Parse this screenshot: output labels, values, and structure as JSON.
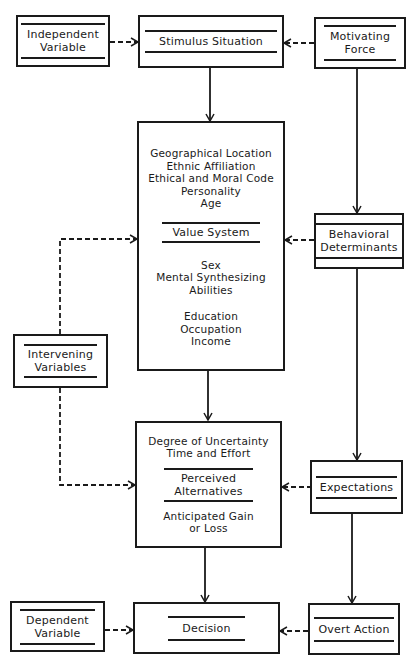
{
  "diagram": {
    "nodes": {
      "independent_variable": {
        "title": [
          "Independent",
          "Variable"
        ]
      },
      "stimulus_situation": {
        "title": [
          "Stimulus Situation"
        ]
      },
      "motivating_force": {
        "title": [
          "Motivating",
          "Force"
        ]
      },
      "value_system_box": {
        "pre_items": [
          "Geographical Location",
          "Ethnic Affiliation",
          "Ethical and Moral Code",
          "Personality",
          "Age"
        ],
        "title": "Value System",
        "post_items_1": [
          "Sex",
          "Mental Synthesizing",
          "Abilities"
        ],
        "post_items_2": [
          "Education",
          "Occupation",
          "Income"
        ]
      },
      "behavioral_determinants": {
        "title": [
          "Behavioral",
          "Determinants"
        ]
      },
      "intervening_variables": {
        "title": [
          "Intervening",
          "Variables"
        ]
      },
      "perceived_alternatives_box": {
        "pre_items": [
          "Degree of Uncertainty",
          "Time and Effort"
        ],
        "title": [
          "Perceived",
          "Alternatives"
        ],
        "post_items": [
          "Anticipated Gain",
          "or Loss"
        ]
      },
      "expectations": {
        "title": [
          "Expectations"
        ]
      },
      "dependent_variable": {
        "title": [
          "Dependent",
          "Variable"
        ]
      },
      "decision": {
        "title": [
          "Decision"
        ]
      },
      "overt_action": {
        "title": [
          "Overt Action"
        ]
      }
    },
    "edges": [
      {
        "from": "independent_variable",
        "to": "stimulus_situation",
        "style": "dashed"
      },
      {
        "from": "motivating_force",
        "to": "stimulus_situation",
        "style": "dashed"
      },
      {
        "from": "stimulus_situation",
        "to": "value_system_box",
        "style": "solid"
      },
      {
        "from": "motivating_force",
        "to": "behavioral_determinants",
        "style": "solid"
      },
      {
        "from": "behavioral_determinants",
        "to": "value_system_box",
        "style": "dashed"
      },
      {
        "from": "intervening_variables",
        "to": "value_system_box",
        "style": "dashed"
      },
      {
        "from": "intervening_variables",
        "to": "perceived_alternatives_box",
        "style": "dashed"
      },
      {
        "from": "value_system_box",
        "to": "perceived_alternatives_box",
        "style": "solid"
      },
      {
        "from": "behavioral_determinants",
        "to": "expectations",
        "style": "solid"
      },
      {
        "from": "expectations",
        "to": "perceived_alternatives_box",
        "style": "dashed"
      },
      {
        "from": "perceived_alternatives_box",
        "to": "decision",
        "style": "solid"
      },
      {
        "from": "expectations",
        "to": "overt_action",
        "style": "solid"
      },
      {
        "from": "dependent_variable",
        "to": "decision",
        "style": "dashed"
      },
      {
        "from": "overt_action",
        "to": "decision",
        "style": "dashed"
      }
    ]
  }
}
